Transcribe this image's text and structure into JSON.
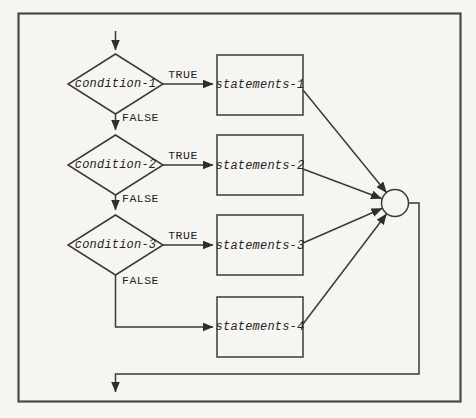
{
  "colors": {
    "paper": "#f6f5f1",
    "line": "#3a3a3a",
    "text": "#242424"
  },
  "flowchart": {
    "type": "multi-way-selection-flowchart",
    "branches": [
      {
        "condition": "condition-1",
        "true_label": "TRUE",
        "false_label": "FALSE",
        "statements": "statements-1"
      },
      {
        "condition": "condition-2",
        "true_label": "TRUE",
        "false_label": "FALSE",
        "statements": "statements-2"
      },
      {
        "condition": "condition-3",
        "true_label": "TRUE",
        "false_label": "FALSE",
        "statements": "statements-3"
      }
    ],
    "else_statements": "statements-4",
    "connector_shape": "circle"
  }
}
